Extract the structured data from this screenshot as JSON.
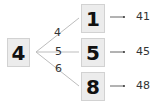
{
  "diagram": {
    "root": "4",
    "branches": [
      {
        "edge": "4",
        "node": "1",
        "result": "41"
      },
      {
        "edge": "5",
        "node": "5",
        "result": "45"
      },
      {
        "edge": "6",
        "node": "8",
        "result": "48"
      }
    ]
  }
}
